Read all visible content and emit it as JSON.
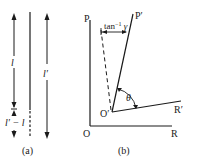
{
  "figure": {
    "panel_a": {
      "caption": "(a)",
      "length_label_l": "l",
      "length_label_l_prime": "l′",
      "difference_label": "l′ − l"
    },
    "panel_b": {
      "caption": "(b)",
      "axis_labels": {
        "P": "P",
        "O": "O",
        "R": "R",
        "P_prime": "P′",
        "O_prime": "O′",
        "R_prime": "R′"
      },
      "shear_angle_label": "tan⁻¹ γ",
      "angle_label": "θ"
    },
    "colors": {
      "stroke": "#1a1a1a",
      "background": "#ffffff"
    }
  }
}
